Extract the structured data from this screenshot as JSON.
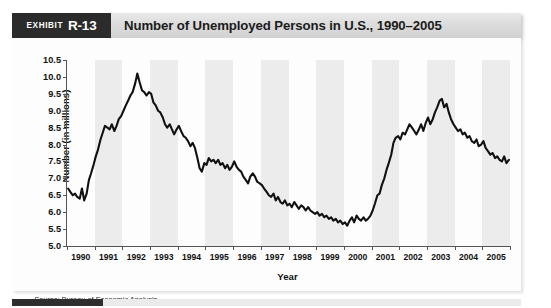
{
  "exhibit": {
    "word": "Exhibit",
    "number": "R-13"
  },
  "header": {
    "title": "Number of Unemployed Persons in U.S., 1990–2005"
  },
  "source": {
    "prefix": "Source:",
    "text": "Bureau of Economic Analysis"
  },
  "colors": {
    "tag_background": "#2b2b2b",
    "title_bar_background": "#dcdcdc",
    "series_line": "#111111",
    "band_shade": "#ececec",
    "axis": "#555555",
    "accent_bar": "#2e2e2e"
  },
  "chart_data": {
    "type": "line",
    "title": "Number of Unemployed Persons in U.S., 1990–2005",
    "xlabel": "Year",
    "ylabel": "Number (in millions)",
    "ylim": [
      5.0,
      10.5
    ],
    "xlim": [
      1990,
      2006
    ],
    "grid": false,
    "legend": null,
    "y_ticks": [
      "5.0",
      "5.5",
      "6.0",
      "6.5",
      "7.0",
      "7.5",
      "8.0",
      "8.5",
      "9.0",
      "9.5",
      "10.0",
      "10.5"
    ],
    "y_tick_values": [
      5.0,
      5.5,
      6.0,
      6.5,
      7.0,
      7.5,
      8.0,
      8.5,
      9.0,
      9.5,
      10.0,
      10.5
    ],
    "x_ticks": [
      "1990",
      "1991",
      "1992",
      "1993",
      "1994",
      "1995",
      "1996",
      "1997",
      "1998",
      "1999",
      "2000",
      "2001",
      "2002",
      "2003",
      "2004",
      "2005"
    ],
    "x_tick_values": [
      1990,
      1991,
      1992,
      1993,
      1994,
      1995,
      1996,
      1997,
      1998,
      1999,
      2000,
      2001,
      2002,
      2003,
      2004,
      2005
    ],
    "band_shaded_years": [
      1991,
      1993,
      1995,
      1997,
      1999,
      2001,
      2003,
      2005
    ],
    "series": [
      {
        "name": "Unemployed persons (millions)",
        "x": [
          1990.04,
          1990.12,
          1990.21,
          1990.29,
          1990.37,
          1990.46,
          1990.54,
          1990.62,
          1990.71,
          1990.79,
          1990.87,
          1990.96,
          1991.04,
          1991.12,
          1991.21,
          1991.29,
          1991.37,
          1991.46,
          1991.54,
          1991.62,
          1991.71,
          1991.79,
          1991.87,
          1991.96,
          1992.04,
          1992.12,
          1992.21,
          1992.29,
          1992.37,
          1992.46,
          1992.54,
          1992.62,
          1992.71,
          1992.79,
          1992.87,
          1992.96,
          1993.04,
          1993.12,
          1993.21,
          1993.29,
          1993.37,
          1993.46,
          1993.54,
          1993.62,
          1993.71,
          1993.79,
          1993.87,
          1993.96,
          1994.04,
          1994.12,
          1994.21,
          1994.29,
          1994.37,
          1994.46,
          1994.54,
          1994.62,
          1994.71,
          1994.79,
          1994.87,
          1994.96,
          1995.04,
          1995.12,
          1995.21,
          1995.29,
          1995.37,
          1995.46,
          1995.54,
          1995.62,
          1995.71,
          1995.79,
          1995.87,
          1995.96,
          1996.04,
          1996.12,
          1996.21,
          1996.29,
          1996.37,
          1996.46,
          1996.54,
          1996.62,
          1996.71,
          1996.79,
          1996.87,
          1996.96,
          1997.04,
          1997.12,
          1997.21,
          1997.29,
          1997.37,
          1997.46,
          1997.54,
          1997.62,
          1997.71,
          1997.79,
          1997.87,
          1997.96,
          1998.04,
          1998.12,
          1998.21,
          1998.29,
          1998.37,
          1998.46,
          1998.54,
          1998.62,
          1998.71,
          1998.79,
          1998.87,
          1998.96,
          1999.04,
          1999.12,
          1999.21,
          1999.29,
          1999.37,
          1999.46,
          1999.54,
          1999.62,
          1999.71,
          1999.79,
          1999.87,
          1999.96,
          2000.04,
          2000.12,
          2000.21,
          2000.29,
          2000.37,
          2000.46,
          2000.54,
          2000.62,
          2000.71,
          2000.79,
          2000.87,
          2000.96,
          2001.04,
          2001.12,
          2001.21,
          2001.29,
          2001.37,
          2001.46,
          2001.54,
          2001.62,
          2001.71,
          2001.79,
          2001.87,
          2001.96,
          2002.04,
          2002.12,
          2002.21,
          2002.29,
          2002.37,
          2002.46,
          2002.54,
          2002.62,
          2002.71,
          2002.79,
          2002.87,
          2002.96,
          2003.04,
          2003.12,
          2003.21,
          2003.29,
          2003.37,
          2003.46,
          2003.54,
          2003.62,
          2003.71,
          2003.79,
          2003.87,
          2003.96,
          2004.04,
          2004.12,
          2004.21,
          2004.29,
          2004.37,
          2004.46,
          2004.54,
          2004.62,
          2004.71,
          2004.79,
          2004.87,
          2004.96,
          2005.04,
          2005.12,
          2005.21,
          2005.29,
          2005.37,
          2005.46,
          2005.54,
          2005.62,
          2005.71,
          2005.79,
          2005.87,
          2005.96
        ],
        "values": [
          6.7,
          6.6,
          6.5,
          6.55,
          6.45,
          6.4,
          6.7,
          6.35,
          6.55,
          6.95,
          7.15,
          7.4,
          7.65,
          7.85,
          8.15,
          8.35,
          8.55,
          8.5,
          8.45,
          8.6,
          8.4,
          8.55,
          8.75,
          8.85,
          9.0,
          9.15,
          9.3,
          9.45,
          9.55,
          9.8,
          10.1,
          9.85,
          9.6,
          9.55,
          9.45,
          9.55,
          9.5,
          9.25,
          9.15,
          9.0,
          8.95,
          8.8,
          8.6,
          8.5,
          8.6,
          8.45,
          8.3,
          8.45,
          8.55,
          8.4,
          8.25,
          8.2,
          8.1,
          7.95,
          8.05,
          7.9,
          7.6,
          7.3,
          7.2,
          7.45,
          7.4,
          7.6,
          7.5,
          7.55,
          7.45,
          7.55,
          7.4,
          7.45,
          7.3,
          7.4,
          7.25,
          7.35,
          7.5,
          7.35,
          7.25,
          7.2,
          7.05,
          6.95,
          6.85,
          7.05,
          7.15,
          7.05,
          6.9,
          6.85,
          6.8,
          6.7,
          6.6,
          6.5,
          6.45,
          6.55,
          6.35,
          6.45,
          6.3,
          6.25,
          6.35,
          6.2,
          6.25,
          6.15,
          6.3,
          6.2,
          6.1,
          6.2,
          6.15,
          6.05,
          6.15,
          6.05,
          6.0,
          5.95,
          6.0,
          5.9,
          5.95,
          5.85,
          5.9,
          5.8,
          5.85,
          5.75,
          5.8,
          5.7,
          5.75,
          5.65,
          5.7,
          5.6,
          5.75,
          5.85,
          5.7,
          5.9,
          5.8,
          5.75,
          5.85,
          5.75,
          5.8,
          5.9,
          6.05,
          6.25,
          6.5,
          6.55,
          6.8,
          7.0,
          7.25,
          7.45,
          7.7,
          8.05,
          8.2,
          8.25,
          8.15,
          8.35,
          8.3,
          8.45,
          8.6,
          8.5,
          8.4,
          8.3,
          8.45,
          8.6,
          8.4,
          8.65,
          8.8,
          8.6,
          8.75,
          8.95,
          9.1,
          9.3,
          9.35,
          9.1,
          9.2,
          8.95,
          8.75,
          8.6,
          8.5,
          8.4,
          8.45,
          8.3,
          8.35,
          8.2,
          8.25,
          8.1,
          8.05,
          8.15,
          7.95,
          8.0,
          8.1,
          7.9,
          7.8,
          7.7,
          7.75,
          7.6,
          7.65,
          7.55,
          7.5,
          7.65,
          7.45,
          7.55
        ]
      }
    ],
    "annotations": {
      "peak_1992": {
        "year": 1992.54,
        "value": 10.1,
        "note": "Recession peak"
      },
      "trough_2000": {
        "year": 2000.12,
        "value": 5.6,
        "note": "Expansion low"
      },
      "peak_2003": {
        "year": 2003.54,
        "value": 9.35,
        "note": "Post-2001 peak"
      }
    }
  }
}
